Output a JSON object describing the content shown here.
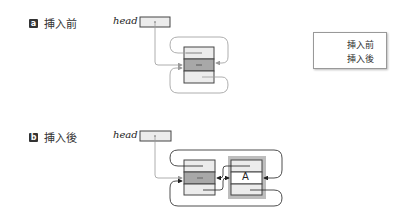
{
  "panels": [
    {
      "badge": "a",
      "title": "挿入前",
      "head_label": "head"
    },
    {
      "badge": "b",
      "title": "挿入後",
      "head_label": "head"
    }
  ],
  "legend": {
    "items": [
      {
        "label": "挿入前",
        "color": "#9a9a9a"
      },
      {
        "label": "挿入後",
        "color": "#222222"
      }
    ]
  },
  "nodes": {
    "dummy_fill_top": "#e8e8e8",
    "dummy_fill_mid": "#a8a8a8",
    "inserted_label": "A"
  }
}
